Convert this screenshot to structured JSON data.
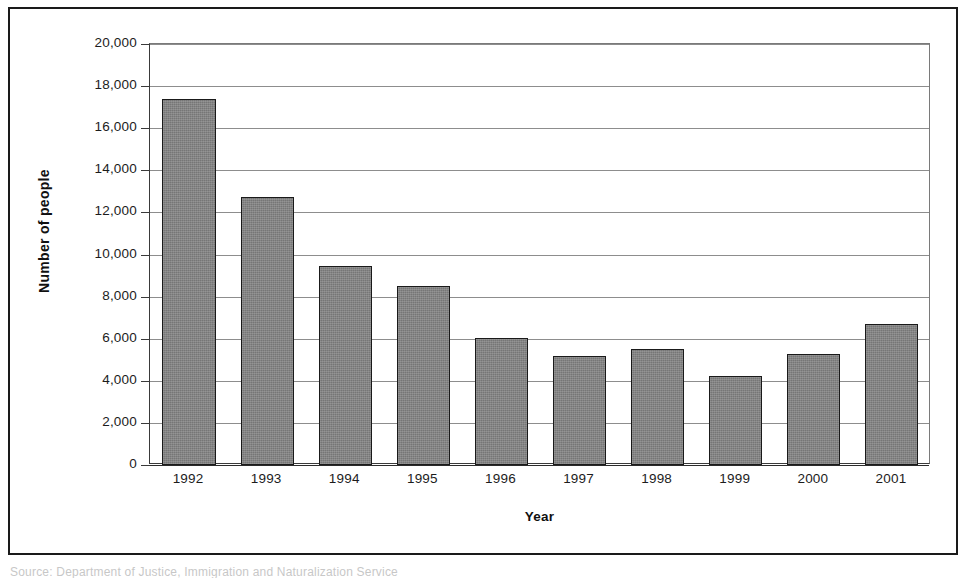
{
  "chart_data": {
    "type": "bar",
    "title": "",
    "xlabel": "Year",
    "ylabel": "Number of people",
    "categories": [
      "1992",
      "1993",
      "1994",
      "1995",
      "1996",
      "1997",
      "1998",
      "1999",
      "2000",
      "2001"
    ],
    "values": [
      17400,
      12750,
      9450,
      8500,
      6050,
      5200,
      5500,
      4250,
      5250,
      6700
    ],
    "ylim": [
      0,
      20000
    ],
    "ytick_step": 2000,
    "ytick_labels": [
      "20,000",
      "18,000",
      "16,000",
      "14,000",
      "12,000",
      "10,000",
      "8,000",
      "6,000",
      "4,000",
      "2,000",
      "0"
    ],
    "ytick_values": [
      20000,
      18000,
      16000,
      14000,
      12000,
      10000,
      8000,
      6000,
      4000,
      2000,
      0
    ],
    "grid": true,
    "grid_axis": "y",
    "legend": false,
    "legend_position": "none",
    "bar_fill_color": "#767676",
    "bar_border_color": "#1a1a1a",
    "axis_color": "#2b2b2b",
    "gridline_color": "#8d8d8d",
    "background_color": "#ffffff"
  },
  "figure": {
    "frame_border_color": "#1a1a1a",
    "source_caption": "Source: Department of Justice, Immigration and Naturalization Service"
  }
}
